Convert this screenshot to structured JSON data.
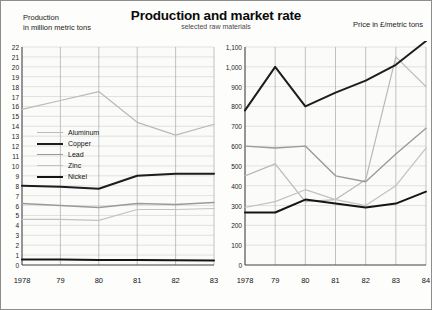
{
  "header": {
    "title": "Production and market rate",
    "subtitle": "selected raw materials",
    "left_axis_title": "Production\nin million metric tons",
    "left_axis_title_line1": "Production",
    "left_axis_title_line2": "in million metric tons",
    "right_axis_title": "Price in £/metric tons"
  },
  "legend": {
    "items": [
      {
        "label": "Aluminum",
        "color": "#b9b9b9",
        "width": 1.2
      },
      {
        "label": "Copper",
        "color": "#1d1d1d",
        "width": 2.0
      },
      {
        "label": "Lead",
        "color": "#9a9a9a",
        "width": 1.4
      },
      {
        "label": "Zinc",
        "color": "#c2c2c2",
        "width": 1.2
      },
      {
        "label": "Nickel",
        "color": "#151515",
        "width": 2.0
      }
    ]
  },
  "chart_data": [
    {
      "id": "production",
      "type": "line",
      "title": "Production",
      "ylabel": "in million metric tons",
      "xlabel": "",
      "x": [
        "1978",
        "79",
        "80",
        "81",
        "82",
        "83"
      ],
      "tick_labels": [
        "1978",
        "79",
        "80",
        "81",
        "82",
        "83"
      ],
      "ylim": [
        0,
        22
      ],
      "yticks": [
        0,
        1,
        2,
        3,
        4,
        5,
        6,
        7,
        8,
        9,
        10,
        11,
        12,
        13,
        14,
        15,
        16,
        17,
        18,
        19,
        20,
        21,
        22
      ],
      "grid": true,
      "legend_position": "inside-left",
      "series": [
        {
          "name": "Aluminum",
          "color": "#b9b9b9",
          "width": 1.2,
          "values": [
            15.7,
            16.6,
            17.5,
            14.4,
            13.1,
            14.2
          ]
        },
        {
          "name": "Copper",
          "color": "#1d1d1d",
          "width": 2.0,
          "values": [
            8.0,
            7.9,
            7.7,
            9.0,
            9.2,
            9.2
          ]
        },
        {
          "name": "Lead",
          "color": "#9a9a9a",
          "width": 1.4,
          "values": [
            6.2,
            6.0,
            5.8,
            6.2,
            6.1,
            6.3
          ]
        },
        {
          "name": "Zinc",
          "color": "#c2c2c2",
          "width": 1.2,
          "values": [
            4.6,
            4.6,
            4.5,
            5.6,
            5.6,
            5.7
          ]
        },
        {
          "name": "Nickel",
          "color": "#151515",
          "width": 2.0,
          "values": [
            0.55,
            0.55,
            0.5,
            0.5,
            0.48,
            0.45
          ]
        }
      ]
    },
    {
      "id": "market-rate",
      "type": "line",
      "title": "Market rate",
      "ylabel": "Price in £/metric tons",
      "xlabel": "",
      "x": [
        "1978",
        "79",
        "80",
        "81",
        "82",
        "83",
        "84"
      ],
      "tick_labels": [
        "1978",
        "79",
        "80",
        "81",
        "82",
        "83",
        "84"
      ],
      "ylim": [
        0,
        1100
      ],
      "yticks": [
        0,
        100,
        200,
        300,
        400,
        500,
        600,
        700,
        800,
        900,
        1000,
        1100
      ],
      "ytick_labels": [
        "0",
        "100",
        "200",
        "300",
        "400",
        "500",
        "600",
        "700",
        "800",
        "900",
        "1,000",
        "1,100"
      ],
      "grid": true,
      "legend_position": "none",
      "series": [
        {
          "name": "Aluminum",
          "color": "#b9b9b9",
          "width": 1.2,
          "values": [
            450,
            510,
            320,
            330,
            430,
            1050,
            900
          ]
        },
        {
          "name": "Copper",
          "color": "#1d1d1d",
          "width": 2.0,
          "values": [
            780,
            1000,
            800,
            870,
            930,
            1010,
            1130
          ]
        },
        {
          "name": "Lead",
          "color": "#9a9a9a",
          "width": 1.4,
          "values": [
            600,
            590,
            600,
            450,
            420,
            560,
            690
          ]
        },
        {
          "name": "Zinc",
          "color": "#c2c2c2",
          "width": 1.2,
          "values": [
            290,
            320,
            380,
            330,
            300,
            400,
            590
          ]
        },
        {
          "name": "Nickel",
          "color": "#151515",
          "width": 2.0,
          "values": [
            265,
            265,
            330,
            310,
            290,
            310,
            370
          ]
        }
      ]
    }
  ]
}
